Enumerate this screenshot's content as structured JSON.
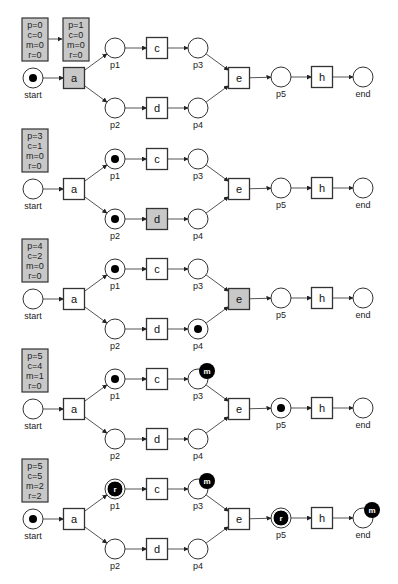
{
  "colors": {
    "stroke": "#333333",
    "edge": "#555555",
    "counter_fill": "#c8c8c8",
    "fired_fill": "#c8c8c8",
    "token": "#000000",
    "place_fill": "#ffffff"
  },
  "layout": {
    "panel_offsets": [
      0,
      111,
      221,
      331,
      441
    ],
    "place_radius": 10,
    "transition_size": 21
  },
  "places": {
    "start": {
      "label": "start",
      "x": 33,
      "y": 78
    },
    "p1": {
      "label": "p1",
      "x": 115,
      "y": 48
    },
    "p2": {
      "label": "p2",
      "x": 115,
      "y": 108
    },
    "p3": {
      "label": "p3",
      "x": 198,
      "y": 48
    },
    "p4": {
      "label": "p4",
      "x": 198,
      "y": 108
    },
    "p5": {
      "label": "p5",
      "x": 281,
      "y": 77
    },
    "end": {
      "label": "end",
      "x": 363,
      "y": 77
    }
  },
  "transitions": {
    "a": {
      "label": "a",
      "x": 74,
      "y": 78
    },
    "c": {
      "label": "c",
      "x": 157,
      "y": 48
    },
    "d": {
      "label": "d",
      "x": 157,
      "y": 108
    },
    "e": {
      "label": "e",
      "x": 239,
      "y": 78
    },
    "h": {
      "label": "h",
      "x": 322,
      "y": 77
    }
  },
  "arcs": [
    [
      "start",
      "a"
    ],
    [
      "a",
      "p1"
    ],
    [
      "a",
      "p2"
    ],
    [
      "p1",
      "c"
    ],
    [
      "p2",
      "d"
    ],
    [
      "c",
      "p3"
    ],
    [
      "d",
      "p4"
    ],
    [
      "p3",
      "e"
    ],
    [
      "p4",
      "e"
    ],
    [
      "e",
      "p5"
    ],
    [
      "p5",
      "h"
    ],
    [
      "h",
      "end"
    ]
  ],
  "panels": [
    {
      "counters": [
        {
          "p": "p=0",
          "c": "c=0",
          "m": "m=0",
          "r": "r=0"
        },
        {
          "p": "p=1",
          "c": "c=0",
          "m": "m=0",
          "r": "r=0"
        }
      ],
      "fired": [
        "a"
      ],
      "tokens": [
        "start"
      ],
      "remaining": [],
      "missing": []
    },
    {
      "counters": [
        {
          "p": "p=3",
          "c": "c=1",
          "m": "m=0",
          "r": "r=0"
        }
      ],
      "fired": [
        "d"
      ],
      "tokens": [
        "p1",
        "p2"
      ],
      "remaining": [],
      "missing": []
    },
    {
      "counters": [
        {
          "p": "p=4",
          "c": "c=2",
          "m": "m=0",
          "r": "r=0"
        }
      ],
      "fired": [
        "e"
      ],
      "tokens": [
        "p1",
        "p4"
      ],
      "remaining": [],
      "missing": []
    },
    {
      "counters": [
        {
          "p": "p=5",
          "c": "c=4",
          "m": "m=1",
          "r": "r=0"
        }
      ],
      "fired": [],
      "tokens": [
        "p1",
        "p5"
      ],
      "remaining": [],
      "missing": [
        "p3"
      ]
    },
    {
      "counters": [
        {
          "p": "p=5",
          "c": "c=5",
          "m": "m=2",
          "r": "r=2"
        }
      ],
      "fired": [],
      "tokens": [
        "start"
      ],
      "remaining": [
        "p1",
        "p5"
      ],
      "missing": [
        "p3",
        "end"
      ]
    }
  ],
  "token_letters": {
    "remaining": "r",
    "missing": "m"
  }
}
